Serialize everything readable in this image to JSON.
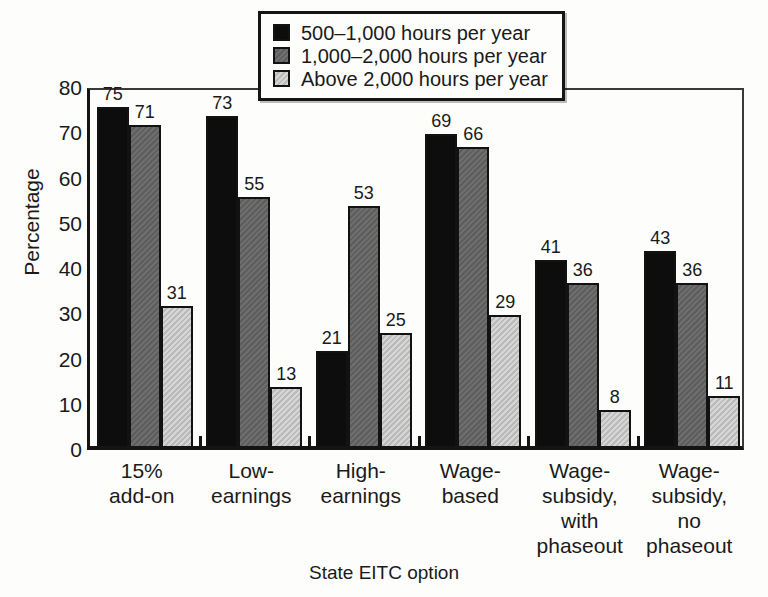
{
  "chart_data": {
    "type": "bar",
    "title": "",
    "xlabel": "State EITC option",
    "ylabel": "Percentage",
    "ylim": [
      0,
      80
    ],
    "yticks": [
      0,
      10,
      20,
      30,
      40,
      50,
      60,
      70,
      80
    ],
    "grid": false,
    "legend_position": "top-center",
    "categories": [
      "15% add-on",
      "Low-earnings",
      "High-earnings",
      "Wage-based",
      "Wage-subsidy, with phaseout",
      "Wage-subsidy, no phaseout"
    ],
    "category_lines": [
      [
        "15%",
        "add-on"
      ],
      [
        "Low-",
        "earnings"
      ],
      [
        "High-",
        "earnings"
      ],
      [
        "Wage-",
        "based"
      ],
      [
        "Wage-",
        "subsidy,",
        "with",
        "phaseout"
      ],
      [
        "Wage-",
        "subsidy,",
        "no",
        "phaseout"
      ]
    ],
    "series": [
      {
        "name": "500–1,000 hours per year",
        "color": "#0d0d0d",
        "values": [
          75,
          73,
          21,
          69,
          41,
          43
        ]
      },
      {
        "name": "1,000–2,000 hours per year",
        "color": "#636363",
        "values": [
          71,
          55,
          53,
          66,
          36,
          36
        ]
      },
      {
        "name": "Above 2,000 hours per year",
        "color": "#c4c4c4",
        "values": [
          31,
          13,
          25,
          29,
          8,
          11
        ]
      }
    ]
  },
  "legend": {
    "items": [
      {
        "label": "500–1,000 hours per year"
      },
      {
        "label": "1,000–2,000 hours per year"
      },
      {
        "label": "Above 2,000 hours per year"
      }
    ]
  },
  "axes": {
    "y_title": "Percentage",
    "x_title": "State EITC option",
    "y_ticks": [
      "80",
      "70",
      "60",
      "50",
      "40",
      "30",
      "20",
      "10",
      "0"
    ]
  }
}
